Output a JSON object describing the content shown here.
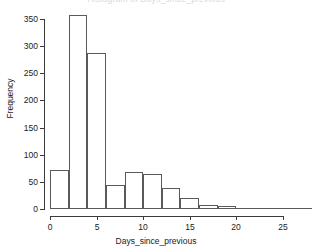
{
  "chart_data": {
    "type": "bar",
    "title": "Histogram of Days_since_previous",
    "xlabel": "Days_since_previous",
    "ylabel": "Frequency",
    "bin_width": 2,
    "categories": [
      "0-2",
      "2-4",
      "4-6",
      "6-8",
      "8-10",
      "10-12",
      "12-14",
      "14-16",
      "16-18",
      "18-20",
      "20-22",
      "22-24",
      "24-26",
      "26-28"
    ],
    "bin_starts": [
      0,
      2,
      4,
      6,
      8,
      10,
      12,
      14,
      16,
      18,
      20,
      22,
      24,
      26
    ],
    "values": [
      72,
      358,
      288,
      45,
      68,
      65,
      38,
      20,
      8,
      5,
      2,
      0,
      2,
      0
    ],
    "xlim": [
      0,
      28
    ],
    "ylim": [
      0,
      360
    ],
    "xticks": [
      0,
      5,
      10,
      15,
      20,
      25
    ],
    "xtick_labels": [
      "0",
      "5",
      "10",
      "15",
      "20",
      "25"
    ],
    "yticks": [
      0,
      50,
      100,
      150,
      200,
      250,
      300,
      350
    ],
    "ytick_labels": [
      "0",
      "50",
      "100",
      "150",
      "200",
      "250",
      "300",
      "350"
    ],
    "grid": false,
    "legend": null,
    "bar_fill_color": "#ffffff",
    "bar_edge_color": "#5a5a5a",
    "axis_color": "#3b3b3b",
    "background_color": "#ffffff"
  }
}
